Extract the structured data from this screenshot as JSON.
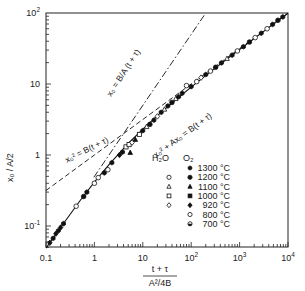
{
  "chart_data": {
    "type": "scatter",
    "title": "",
    "xlabel": "(t + τ) / (A²/4B)",
    "ylabel": "x_o / A/2",
    "xscale": "log",
    "yscale": "log",
    "xlim": [
      0.1,
      10000
    ],
    "ylim": [
      0.045,
      100
    ],
    "grid": false,
    "x_ticks": [
      "0.1",
      "1",
      "10",
      "10^2",
      "10^3",
      "10^4"
    ],
    "y_ticks": [
      "10^-1",
      "1",
      "10",
      "10^2"
    ],
    "curves": [
      {
        "name": "general relation",
        "label": "x_o² + A x_o = B(t + τ)",
        "style": "solid",
        "x": [
          0.1,
          0.2,
          0.5,
          1,
          2,
          5,
          10,
          20,
          50,
          100,
          200,
          500,
          1000,
          2000,
          5000,
          10000
        ],
        "y": [
          0.0488,
          0.0954,
          0.225,
          0.414,
          0.732,
          1.45,
          2.32,
          3.58,
          6.14,
          9.05,
          13.2,
          21.4,
          30.6,
          43.7,
          69.7,
          99.0
        ]
      },
      {
        "name": "linear law",
        "label": "x_o = (B/A)(t + τ)",
        "style": "dash-dot",
        "x": [
          1,
          10,
          50
        ],
        "y": [
          0.5,
          5,
          25
        ]
      },
      {
        "name": "parabolic law",
        "label": "x_o² = B(t + τ)",
        "style": "dashed",
        "x": [
          0.1,
          1,
          10,
          100,
          1000,
          10000
        ],
        "y": [
          0.316,
          1,
          3.16,
          10,
          31.6,
          100
        ]
      }
    ],
    "legend": {
      "position": "lower right inside plot",
      "column_headers": [
        "H2O",
        "O2"
      ],
      "entries": [
        {
          "temperature": "1300 °C",
          "h2o_marker": null,
          "o2_marker": "filled-hexagon"
        },
        {
          "temperature": "1200 °C",
          "h2o_marker": "open-circle",
          "o2_marker": "filled-circle"
        },
        {
          "temperature": "1100 °C",
          "h2o_marker": "open-triangle",
          "o2_marker": "filled-triangle"
        },
        {
          "temperature": "1000 °C",
          "h2o_marker": "open-square",
          "o2_marker": "filled-square"
        },
        {
          "temperature": "920 °C",
          "h2o_marker": "open-diamond",
          "o2_marker": "filled-diamond"
        },
        {
          "temperature": "800 °C",
          "h2o_marker": null,
          "o2_marker": "open-circle"
        },
        {
          "temperature": "700 °C",
          "h2o_marker": null,
          "o2_marker": "half-filled-circle"
        }
      ]
    },
    "points": [
      {
        "x": 0.12,
        "y": 0.058,
        "marker": "filled-diamond"
      },
      {
        "x": 0.14,
        "y": 0.067,
        "marker": "filled-hexagon"
      },
      {
        "x": 0.16,
        "y": 0.078,
        "marker": "filled-diamond"
      },
      {
        "x": 0.18,
        "y": 0.086,
        "marker": "filled-hexagon"
      },
      {
        "x": 0.2,
        "y": 0.095,
        "marker": "filled-diamond"
      },
      {
        "x": 0.23,
        "y": 0.108,
        "marker": "filled-hexagon"
      },
      {
        "x": 0.42,
        "y": 0.19,
        "marker": "open-circle"
      },
      {
        "x": 0.6,
        "y": 0.26,
        "marker": "filled-circle"
      },
      {
        "x": 0.7,
        "y": 0.3,
        "marker": "filled-hexagon"
      },
      {
        "x": 1.0,
        "y": 0.4,
        "marker": "open-circle"
      },
      {
        "x": 1.2,
        "y": 0.48,
        "marker": "open-circle"
      },
      {
        "x": 1.6,
        "y": 0.56,
        "marker": "filled-hexagon"
      },
      {
        "x": 1.9,
        "y": 0.62,
        "marker": "open-circle"
      },
      {
        "x": 2.3,
        "y": 0.78,
        "marker": "filled-hexagon"
      },
      {
        "x": 3.3,
        "y": 1.0,
        "marker": "filled-diamond"
      },
      {
        "x": 3.8,
        "y": 1.1,
        "marker": "filled-hexagon"
      },
      {
        "x": 4.5,
        "y": 1.3,
        "marker": "open-square"
      },
      {
        "x": 5.2,
        "y": 1.4,
        "marker": "open-square"
      },
      {
        "x": 6.0,
        "y": 1.5,
        "marker": "open-diamond"
      },
      {
        "x": 7.0,
        "y": 1.65,
        "marker": "filled-triangle"
      },
      {
        "x": 5.5,
        "y": 1.08,
        "marker": "filled-triangle"
      },
      {
        "x": 8.5,
        "y": 1.95,
        "marker": "open-square"
      },
      {
        "x": 10,
        "y": 2.2,
        "marker": "filled-hexagon"
      },
      {
        "x": 12,
        "y": 2.5,
        "marker": "open-triangle"
      },
      {
        "x": 14,
        "y": 2.7,
        "marker": "filled-circle"
      },
      {
        "x": 17,
        "y": 3.1,
        "marker": "filled-hexagon"
      },
      {
        "x": 20,
        "y": 3.5,
        "marker": "open-diamond"
      },
      {
        "x": 24,
        "y": 4.0,
        "marker": "filled-hexagon"
      },
      {
        "x": 28,
        "y": 4.4,
        "marker": "open-triangle"
      },
      {
        "x": 33,
        "y": 4.9,
        "marker": "filled-hexagon"
      },
      {
        "x": 40,
        "y": 5.5,
        "marker": "filled-circle"
      },
      {
        "x": 48,
        "y": 6.2,
        "marker": "open-triangle"
      },
      {
        "x": 55,
        "y": 6.6,
        "marker": "filled-hexagon"
      },
      {
        "x": 65,
        "y": 7.4,
        "marker": "filled-hexagon"
      },
      {
        "x": 80,
        "y": 9.5,
        "marker": "open-circle"
      },
      {
        "x": 100,
        "y": 9.2,
        "marker": "filled-hexagon"
      },
      {
        "x": 130,
        "y": 10.8,
        "marker": "open-circle"
      },
      {
        "x": 160,
        "y": 12.3,
        "marker": "open-diamond"
      },
      {
        "x": 200,
        "y": 13.6,
        "marker": "filled-hexagon"
      },
      {
        "x": 250,
        "y": 15.2,
        "marker": "open-circle"
      },
      {
        "x": 320,
        "y": 17.2,
        "marker": "filled-circle"
      },
      {
        "x": 420,
        "y": 19.8,
        "marker": "filled-hexagon"
      },
      {
        "x": 550,
        "y": 22.8,
        "marker": "open-triangle"
      },
      {
        "x": 700,
        "y": 25.5,
        "marker": "filled-hexagon"
      },
      {
        "x": 900,
        "y": 29.2,
        "marker": "open-circle"
      },
      {
        "x": 1200,
        "y": 33.5,
        "marker": "filled-hexagon"
      },
      {
        "x": 1600,
        "y": 39.0,
        "marker": "filled-circle"
      },
      {
        "x": 2100,
        "y": 45.0,
        "marker": "open-circle"
      },
      {
        "x": 2800,
        "y": 52.0,
        "marker": "filled-hexagon"
      },
      {
        "x": 3700,
        "y": 60.0,
        "marker": "open-circle"
      },
      {
        "x": 4800,
        "y": 69.0,
        "marker": "filled-hexagon"
      },
      {
        "x": 6200,
        "y": 79.0,
        "marker": "filled-circle"
      },
      {
        "x": 7800,
        "y": 88.0,
        "marker": "filled-hexagon"
      }
    ]
  },
  "labels": {
    "ylabel": "x₀ / A/2",
    "xlabel_numerator": "t + τ",
    "xlabel_denominator": "A²/4B",
    "curve_linear": "x₀ = B/A (t + τ)",
    "curve_parabolic": "x₀² = B(t + τ)",
    "curve_general": "x₀² + Ax₀ = B(t + τ)",
    "legend_header_h2o": "H₂O",
    "legend_header_o2": "O₂"
  }
}
